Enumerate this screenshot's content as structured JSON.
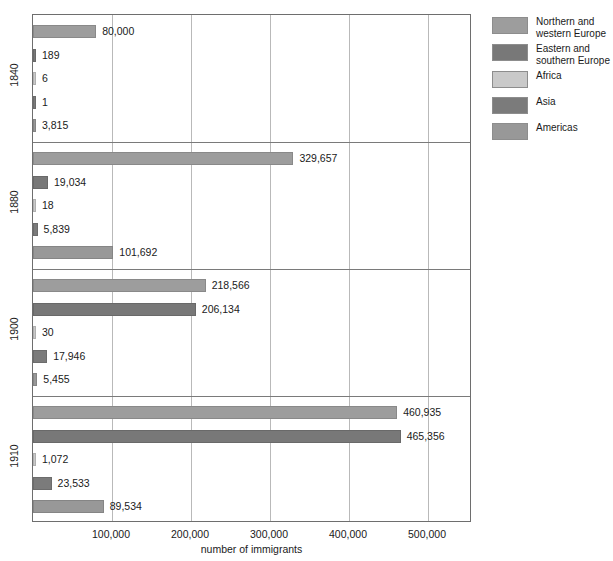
{
  "chart_data": {
    "type": "bar",
    "orientation": "horizontal",
    "title": "",
    "xlabel": "number of immigrants",
    "ylabel": "",
    "xlim": [
      0,
      555000
    ],
    "xticks": [
      "100,000",
      "200,000",
      "300,000",
      "400,000",
      "500,000"
    ],
    "xtick_values": [
      100000,
      200000,
      300000,
      400000,
      500000
    ],
    "grid": true,
    "legend_position": "right",
    "categories": [
      "1840",
      "1880",
      "1900",
      "1910"
    ],
    "series": [
      {
        "name": "Northern and\nwestern Europe",
        "color": "#9d9d9d",
        "values": [
          80000,
          329657,
          218566,
          460935
        ],
        "labels": [
          "80,000",
          "329,657",
          "218,566",
          "460,935"
        ]
      },
      {
        "name": "Eastern and\nsouthern Europe",
        "color": "#787878",
        "values": [
          189,
          19034,
          206134,
          465356
        ],
        "labels": [
          "189",
          "19,034",
          "206,134",
          "465,356"
        ]
      },
      {
        "name": "Africa",
        "color": "#c9c9c9",
        "values": [
          6,
          18,
          30,
          1072
        ],
        "labels": [
          "6",
          "18",
          "30",
          "1,072"
        ]
      },
      {
        "name": "Asia",
        "color": "#7b7b7b",
        "values": [
          1,
          5839,
          17946,
          23533
        ],
        "labels": [
          "1",
          "5,839",
          "17,946",
          "23,533"
        ]
      },
      {
        "name": "Americas",
        "color": "#989898",
        "values": [
          3815,
          101692,
          5455,
          89534
        ],
        "labels": [
          "3,815",
          "101,692",
          "5,455",
          "89,534"
        ]
      }
    ]
  },
  "legend": {
    "items": [
      {
        "label": "Northern and\nwestern Europe",
        "color": "#9d9d9d"
      },
      {
        "label": "Eastern and\nsouthern Europe",
        "color": "#787878"
      },
      {
        "label": "Africa",
        "color": "#c9c9c9"
      },
      {
        "label": "Asia",
        "color": "#7b7b7b"
      },
      {
        "label": "Americas",
        "color": "#989898"
      }
    ]
  },
  "axis": {
    "x_title": "number of immigrants",
    "y_labels": [
      "1840",
      "1880",
      "1900",
      "1910"
    ]
  }
}
